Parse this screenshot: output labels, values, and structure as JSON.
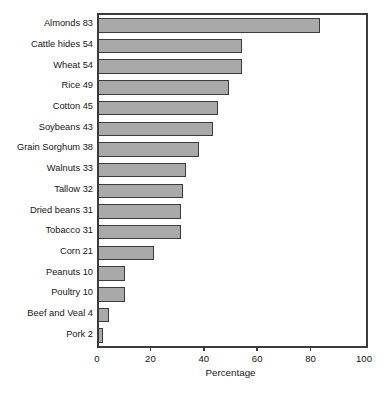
{
  "chart_data": {
    "type": "bar",
    "orientation": "horizontal",
    "title": "",
    "xlabel": "Percentage",
    "ylabel": "",
    "xlim": [
      0,
      100
    ],
    "xticks": [
      0,
      20,
      40,
      60,
      80,
      100
    ],
    "xticklabels": [
      "0",
      "20",
      "40",
      "60",
      "80",
      "100"
    ],
    "grid": false,
    "legend": null,
    "bar_fill_color": "#a9a9a9",
    "bar_edge_color": "#3b3b3b",
    "categories": [
      "Almonds",
      "Cattle hides",
      "Wheat",
      "Rice",
      "Cotton",
      "Soybeans",
      "Grain Sorghum",
      "Walnuts",
      "Tallow",
      "Dried beans",
      "Tobacco",
      "Corn",
      "Peanuts",
      "Poultry",
      "Beef and Veal",
      "Pork"
    ],
    "values": [
      83,
      54,
      54,
      49,
      45,
      43,
      38,
      33,
      32,
      31,
      31,
      21,
      10,
      10,
      4,
      2
    ],
    "ticklabels": [
      "Almonds 83",
      "Cattle hides 54",
      "Wheat 54",
      "Rice 49",
      "Cotton 45",
      "Soybeans 43",
      "Grain Sorghum 38",
      "Walnuts 33",
      "Tallow 32",
      "Dried beans 31",
      "Tobacco 31",
      "Corn 21",
      "Peanuts 10",
      "Poultry 10",
      "Beef and Veal 4",
      "Pork 2"
    ]
  },
  "footer": {
    "sliver_text": ""
  }
}
